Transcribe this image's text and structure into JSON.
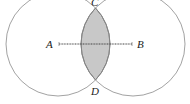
{
  "diagram": {
    "type": "geometry-construction",
    "points": {
      "A": "A",
      "B": "B",
      "C": "C",
      "D": "D"
    },
    "colors": {
      "shade": "#c8c8c8",
      "circle_stroke": "#8a8a8a",
      "segment": "#444444"
    }
  }
}
